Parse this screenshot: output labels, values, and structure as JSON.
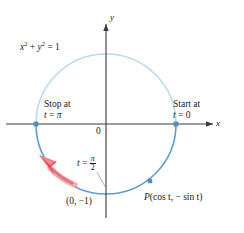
{
  "figure": {
    "type": "unit-circle-diagram",
    "axes": {
      "x_label": "x",
      "y_label": "y",
      "origin_label": "0"
    },
    "circle_equation": {
      "base": "x",
      "exp1": "2",
      "plus": " + ",
      "base2": "y",
      "exp2": "2",
      "equals": " = 1",
      "full": "x² + y² = 1"
    },
    "annotations": {
      "stop": {
        "line1": "Stop at",
        "var": "t",
        "eq": " = ",
        "value": "π"
      },
      "start": {
        "line1": "Start at",
        "var": "t",
        "eq": " = ",
        "value": "0"
      },
      "quarter": {
        "var": "t",
        "eq": " = ",
        "numerator": "π",
        "denominator": "2"
      },
      "bottom_point": "(0, −1)",
      "moving_point": {
        "name": "P",
        "open": "(",
        "cos": "cos t",
        "comma": ", ",
        "sin": "− sin t",
        "close": ")"
      }
    },
    "colors": {
      "arc_light": "#b9d9ed",
      "arc_dark": "#5a9fd4",
      "marker": "#4a90c4",
      "arrow": "#e8505a",
      "arrow_light": "#f3a9ad",
      "axis": "#3a3a3a",
      "leader": "#8a8a8a",
      "text": "#1a1a1a"
    },
    "geometry": {
      "center_x": 106,
      "center_y": 124,
      "radius": 70,
      "point_t_zero": [
        176,
        124
      ],
      "point_t_pi": [
        36,
        124
      ],
      "point_p": [
        150,
        181
      ],
      "point_bottom": [
        106,
        194
      ]
    }
  }
}
